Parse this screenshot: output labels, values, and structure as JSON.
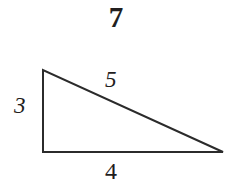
{
  "figure": {
    "number": "7",
    "background_color": "#ffffff",
    "stroke_color": "#2b2b2b",
    "label_color": "#1f1d1d"
  },
  "diagram": {
    "shape": "right-triangle",
    "stroke_width": 2,
    "vertices": {
      "apex": {
        "x": 43,
        "y": 70
      },
      "bottom_left": {
        "x": 43,
        "y": 152
      },
      "bottom_right": {
        "x": 223,
        "y": 152
      }
    },
    "labels": {
      "vertical_leg": "3",
      "hypotenuse": "5",
      "base": "4"
    }
  },
  "chart_data": {
    "type": "diagram",
    "title": "7",
    "shape": "right triangle",
    "annotations": [
      {
        "name": "vertical-leg",
        "value": "3",
        "position": "left"
      },
      {
        "name": "hypotenuse",
        "value": "5",
        "position": "above-right"
      },
      {
        "name": "base",
        "value": "4",
        "position": "below"
      }
    ]
  }
}
